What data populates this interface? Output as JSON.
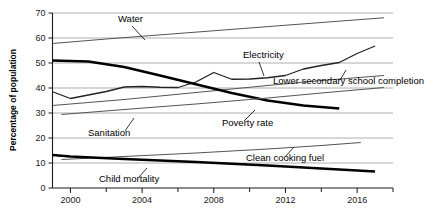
{
  "chart_data": {
    "type": "line",
    "title": "",
    "xlabel": "",
    "ylabel": "Percentage of population",
    "xlim": [
      1999,
      2018
    ],
    "ylim": [
      0,
      70
    ],
    "grid": true,
    "legend_position": "inline-labels",
    "x_ticks": [
      "2000",
      "2004",
      "2008",
      "2012",
      "2016"
    ],
    "x_tick_values": [
      2000,
      2004,
      2008,
      2012,
      2016
    ],
    "x_minor_tick_values": [
      2002,
      2006,
      2010,
      2014,
      2018
    ],
    "y_ticks": [
      "0",
      "10",
      "20",
      "30",
      "40",
      "50",
      "60",
      "70"
    ],
    "y_tick_values": [
      0,
      10,
      20,
      30,
      40,
      50,
      60,
      70
    ],
    "series": [
      {
        "name": "Water",
        "label": "Water",
        "color": "#555555",
        "width": 1.1,
        "x": [
          1999,
          2002,
          2006,
          2010,
          2014,
          2017.5
        ],
        "values": [
          57.8,
          59.6,
          61.8,
          64.0,
          66.2,
          68.1
        ]
      },
      {
        "name": "Electricity",
        "label": "Electricity",
        "color": "#222222",
        "width": 1.3,
        "x": [
          1999,
          2000,
          2001,
          2002,
          2003,
          2004,
          2005,
          2006,
          2007,
          2008,
          2009,
          2010,
          2011,
          2012,
          2013,
          2014,
          2015,
          2016,
          2017
        ],
        "values": [
          38.5,
          35.8,
          37.2,
          38.6,
          40.4,
          40.6,
          40.3,
          40.2,
          42.4,
          46.2,
          43.5,
          43.6,
          44.1,
          45.0,
          47.6,
          49.0,
          50.2,
          53.8,
          56.8
        ]
      },
      {
        "name": "Lower secondary school completion",
        "label": "Lower secondary school completion",
        "color": "#555555",
        "width": 1.1,
        "x": [
          1999,
          2003,
          2007,
          2011,
          2014,
          2017.5
        ],
        "values": [
          33.0,
          35.4,
          38.2,
          41.0,
          43.0,
          45.0
        ]
      },
      {
        "name": "Poverty rate",
        "label": "Poverty rate",
        "color": "#000000",
        "width": 2.6,
        "x": [
          1999,
          2001,
          2003,
          2005,
          2007,
          2009,
          2011,
          2013,
          2015
        ],
        "values": [
          51.0,
          50.6,
          48.4,
          45.0,
          41.5,
          38.0,
          35.0,
          33.0,
          31.8
        ]
      },
      {
        "name": "Sanitation",
        "label": "Sanitation",
        "color": "#555555",
        "width": 1.1,
        "x": [
          1999.5,
          2003,
          2007,
          2011,
          2014,
          2017.5
        ],
        "values": [
          29.4,
          31.4,
          33.6,
          36.0,
          38.0,
          40.2
        ]
      },
      {
        "name": "Clean cooking fuel",
        "label": "Clean cooking fuel",
        "color": "#555555",
        "width": 1.1,
        "x": [
          1999.5,
          2003,
          2007,
          2011,
          2014,
          2016.2
        ],
        "values": [
          11.4,
          12.6,
          14.0,
          15.6,
          17.0,
          18.2
        ]
      },
      {
        "name": "Child mortality",
        "label": "Child mortality",
        "color": "#000000",
        "width": 2.6,
        "x": [
          1999,
          2000,
          2003,
          2007,
          2011,
          2014,
          2017
        ],
        "values": [
          13.2,
          12.6,
          11.6,
          10.4,
          9.0,
          7.8,
          6.6
        ]
      }
    ],
    "annotations": [
      {
        "name": "water-label",
        "text": "Water",
        "text_x": 118,
        "text_y": 22,
        "leader": [
          [
            132,
            26
          ],
          [
            145,
            40
          ]
        ]
      },
      {
        "name": "electricity-label",
        "text": "Electricity",
        "text_x": 243,
        "text_y": 58,
        "leader": [
          [
            259,
            62
          ],
          [
            264,
            76
          ]
        ]
      },
      {
        "name": "lower-secondary-label",
        "text": "Lower secondary school completion",
        "text_x": 273,
        "text_y": 84,
        "leader": [
          [
            340,
            80
          ],
          [
            346,
            70
          ]
        ]
      },
      {
        "name": "poverty-rate-label",
        "text": "Poverty rate",
        "text_x": 222,
        "text_y": 126,
        "leader": [
          [
            244,
            121
          ],
          [
            255,
            110
          ]
        ]
      },
      {
        "name": "sanitation-label",
        "text": "Sanitation",
        "text_x": 88,
        "text_y": 136,
        "leader": [
          [
            125,
            131
          ],
          [
            134,
            118
          ]
        ]
      },
      {
        "name": "clean-cooking-fuel-label",
        "text": "Clean cooking fuel",
        "text_x": 246,
        "text_y": 161,
        "leader": [
          [
            285,
            157
          ],
          [
            294,
            147
          ]
        ]
      },
      {
        "name": "child-mortality-label",
        "text": "Child mortality",
        "text_x": 99,
        "text_y": 182,
        "leader": [
          [
            139,
            177
          ],
          [
            147,
            168
          ]
        ]
      }
    ]
  }
}
